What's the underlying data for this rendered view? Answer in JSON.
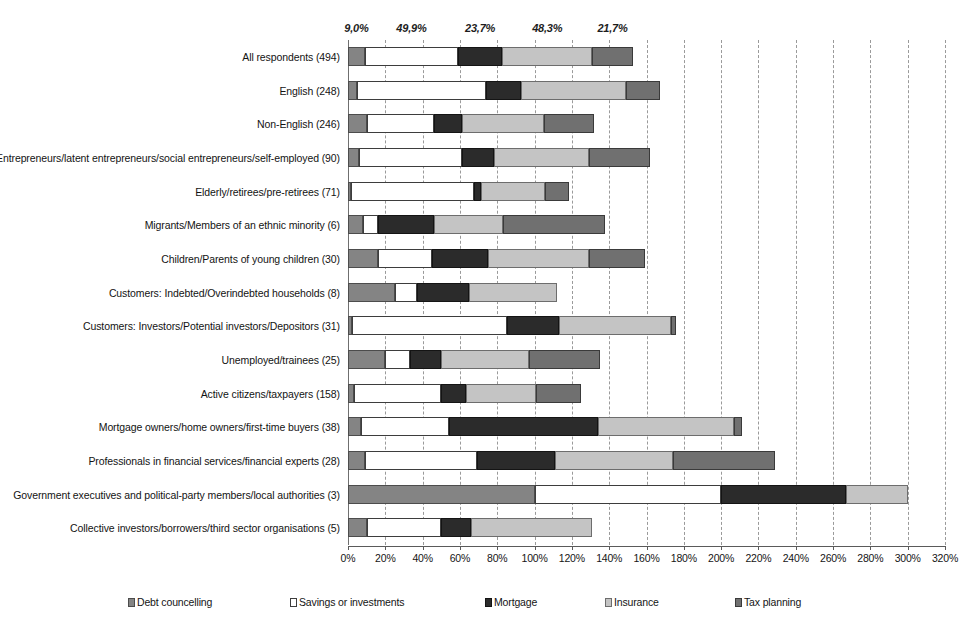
{
  "chart_data": {
    "type": "bar",
    "orientation": "horizontal",
    "stacked": true,
    "title": "",
    "xlabel": "",
    "ylabel": "",
    "xlim": [
      0,
      320
    ],
    "xtick_labels": [
      "0%",
      "20%",
      "40%",
      "60%",
      "80%",
      "100%",
      "120%",
      "140%",
      "160%",
      "180%",
      "200%",
      "220%",
      "240%",
      "260%",
      "280%",
      "300%",
      "320%"
    ],
    "xtick_values": [
      0,
      20,
      40,
      60,
      80,
      100,
      120,
      140,
      160,
      180,
      200,
      220,
      240,
      260,
      280,
      300,
      320
    ],
    "grid": true,
    "legend_position": "bottom",
    "categories": [
      "All respondents (494)",
      "English (248)",
      "Non-English (246)",
      "Entrepreneurs/latent entrepreneurs/social entrepreneurs/self-employed (90)",
      "Elderly/retirees/pre-retirees (71)",
      "Migrants/Members of an ethnic minority (6)",
      "Children/Parents of young children (30)",
      "Customers: Indebted/Overindebted households (8)",
      "Customers: Investors/Potential investors/Depositors (31)",
      "Unemployed/trainees (25)",
      "Active citizens/taxpayers (158)",
      "Mortgage owners/home owners/first-time buyers (38)",
      "Professionals in financial services/financial experts (28)",
      "Government executives and political-party members/local authorities (3)",
      "Collective investors/borrowers/third sector organisations (5)"
    ],
    "series": [
      {
        "name": "Debt councelling",
        "color": "#848484",
        "values": [
          9.0,
          5.0,
          10.0,
          6.0,
          1.5,
          8.0,
          16.0,
          25.0,
          2.0,
          20.0,
          3.0,
          7.0,
          9.0,
          100.0,
          10.0
        ]
      },
      {
        "name": "Savings or investments",
        "color": "#ffffff",
        "values": [
          49.9,
          69.0,
          36.0,
          55.0,
          66.0,
          8.0,
          29.0,
          12.0,
          83.0,
          13.0,
          47.0,
          47.0,
          60.0,
          100.0,
          40.0
        ]
      },
      {
        "name": "Mortgage",
        "color": "#2b2b2b",
        "values": [
          23.7,
          19.0,
          15.0,
          17.0,
          4.0,
          30.0,
          30.0,
          28.0,
          28.0,
          17.0,
          13.0,
          80.0,
          42.0,
          67.0,
          16.0
        ]
      },
      {
        "name": "Insurance",
        "color": "#c4c4c4",
        "values": [
          48.3,
          56.0,
          44.0,
          51.0,
          34.0,
          37.0,
          54.0,
          47.0,
          60.0,
          47.0,
          38.0,
          73.0,
          63.0,
          33.0,
          65.0
        ]
      },
      {
        "name": "Tax planning",
        "color": "#707070",
        "values": [
          21.7,
          18.0,
          27.0,
          33.0,
          13.0,
          55.0,
          30.0,
          0.0,
          3.0,
          38.0,
          24.0,
          4.0,
          55.0,
          0.0,
          0.0
        ]
      }
    ],
    "top_data_labels": [
      {
        "text": "9,0%",
        "value": 9.0,
        "at_percent": 4.5
      },
      {
        "text": "49,9%",
        "value": 49.9,
        "at_percent": 34.0
      },
      {
        "text": "23,7%",
        "value": 23.7,
        "at_percent": 70.8
      },
      {
        "text": "48,3%",
        "value": 48.3,
        "at_percent": 106.8
      },
      {
        "text": "21,7%",
        "value": 21.7,
        "at_percent": 141.8
      }
    ]
  },
  "legend": {
    "items": [
      {
        "label": "Debt councelling",
        "swatch": "s0",
        "left": 128
      },
      {
        "label": "Savings or investments",
        "swatch": "s1",
        "left": 290
      },
      {
        "label": "Mortgage",
        "swatch": "s2",
        "left": 485
      },
      {
        "label": "Insurance",
        "swatch": "s3",
        "left": 605
      },
      {
        "label": "Tax planning",
        "swatch": "s4",
        "left": 735
      }
    ]
  }
}
